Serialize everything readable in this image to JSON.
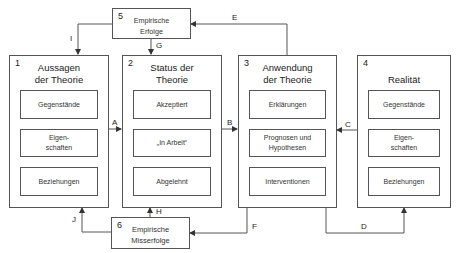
{
  "boxes": {
    "b1": {
      "number": "1",
      "title": "Aussagen\nder Theorie",
      "items": [
        "Gegenstände",
        "Eigen-\nschaften",
        "Beziehungen"
      ]
    },
    "b2": {
      "number": "2",
      "title": "Status der\nTheorie",
      "items": [
        "Akzeptiert",
        "„In Arbeit“",
        "Abgelehnt"
      ]
    },
    "b3": {
      "number": "3",
      "title": "Anwendung\nder Theorie",
      "items": [
        "Erklärungen",
        "Prognosen und\nHypothesen",
        "Interventionen"
      ]
    },
    "b4": {
      "number": "4",
      "title": "Realität",
      "items": [
        "Gegenstände",
        "Eigen-\nschaften",
        "Beziehungen"
      ]
    },
    "b5": {
      "number": "5",
      "title": "Empirische\nErfolge"
    },
    "b6": {
      "number": "6",
      "title": "Empirische\nMisserfolge"
    }
  },
  "edges": {
    "A": "A",
    "B": "B",
    "C": "C",
    "D": "D",
    "E": "E",
    "F": "F",
    "G": "G",
    "H": "H",
    "I": "I",
    "J": "J"
  },
  "colors": {
    "line": "#555555",
    "text": "#222222",
    "background": "#ffffff"
  }
}
